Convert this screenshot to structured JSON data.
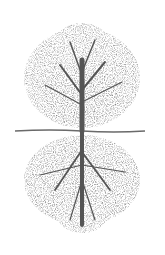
{
  "image": {
    "description": "Grayscale stippled illustration of a tree with its canopy above a horizontal ground line and a mirrored root system below",
    "colors": {
      "background": "#ffffff",
      "foliage": "#8a8a8a",
      "foliage_dark": "#5e5e5e",
      "trunk": "#555555",
      "ground_line": "#6a6a6a"
    }
  }
}
